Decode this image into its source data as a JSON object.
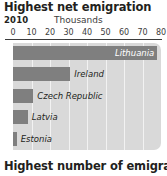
{
  "chart_data": {
    "type": "bar",
    "orientation": "horizontal",
    "title": "Highest net emigration",
    "subtitle": "2010",
    "xlabel": "Thousands",
    "ylabel": "",
    "xlim": [
      0,
      80
    ],
    "xticks": [
      0,
      10,
      20,
      30,
      40,
      50,
      60,
      70,
      80
    ],
    "xtick_labels": [
      "0",
      "10",
      "20",
      "30",
      "40",
      "50",
      "60",
      "70",
      "80"
    ],
    "grid": true,
    "grid_axis": "x",
    "legend": false,
    "categories": [
      "Lithuania",
      "Ireland",
      "Czech Republic",
      "Latvia",
      "Estonia"
    ],
    "values": [
      78,
      31,
      11,
      8,
      2
    ],
    "bars": [
      {
        "label": "Lithuania",
        "value": 78,
        "label_position": "inside"
      },
      {
        "label": "Ireland",
        "value": 31,
        "label_position": "outside"
      },
      {
        "label": "Czech Republic",
        "value": 11,
        "label_position": "outside"
      },
      {
        "label": "Latvia",
        "value": 8,
        "label_position": "outside"
      },
      {
        "label": "Estonia",
        "value": 2,
        "label_position": "outside"
      }
    ]
  },
  "colors": {
    "bar": "#7f7f7f",
    "plot_background": "#d9d9d9",
    "gridline": "#f2f2f2",
    "text": "#231f20",
    "axis": "#3c3c3c"
  },
  "next_section": {
    "heading": "Highest number of emigrants"
  }
}
